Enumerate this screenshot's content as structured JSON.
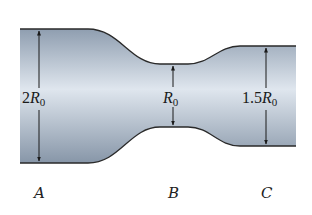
{
  "figure": {
    "colors": {
      "fill_light": "#dfe6ee",
      "fill_dark": "#8f9eb0",
      "outline": "#2a2a2a"
    },
    "sections": [
      {
        "label": "A",
        "dimension": {
          "coef": "2",
          "var": "R",
          "sub": "0"
        }
      },
      {
        "label": "B",
        "dimension": {
          "coef": "",
          "var": "R",
          "sub": "0"
        }
      },
      {
        "label": "C",
        "dimension": {
          "coef": "1.5",
          "var": "R",
          "sub": "0"
        }
      }
    ]
  }
}
